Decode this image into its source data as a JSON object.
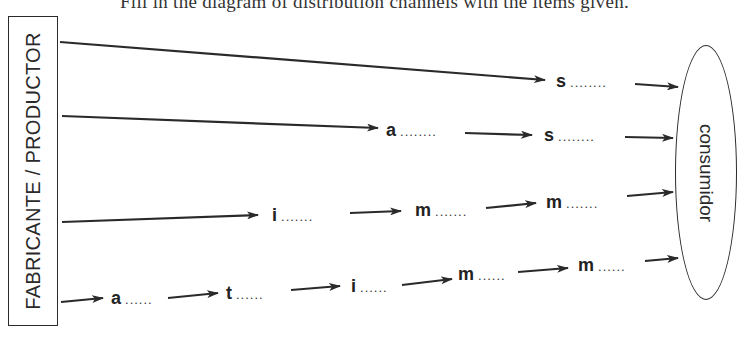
{
  "caption": {
    "text": "Fill in the diagram of distribution channels with the items given."
  },
  "producer": {
    "label": "FABRICANTE / PRODUCTOR"
  },
  "consumer": {
    "label": "consumidor"
  },
  "channels": [
    {
      "nodes": [
        {
          "letter": "s",
          "dots": "........"
        }
      ]
    },
    {
      "nodes": [
        {
          "letter": "a",
          "dots": "........"
        },
        {
          "letter": "s",
          "dots": "........"
        }
      ]
    },
    {
      "nodes": [
        {
          "letter": "i",
          "dots": "......."
        },
        {
          "letter": "m",
          "dots": "......."
        },
        {
          "letter": "m",
          "dots": "......."
        }
      ]
    },
    {
      "nodes": [
        {
          "letter": "a",
          "dots": "......"
        },
        {
          "letter": "t",
          "dots": "......"
        },
        {
          "letter": "i",
          "dots": "......"
        },
        {
          "letter": "m",
          "dots": "......"
        },
        {
          "letter": "m",
          "dots": "......"
        }
      ]
    }
  ],
  "colors": {
    "line": "#2a2a2a",
    "background": "#ffffff"
  }
}
